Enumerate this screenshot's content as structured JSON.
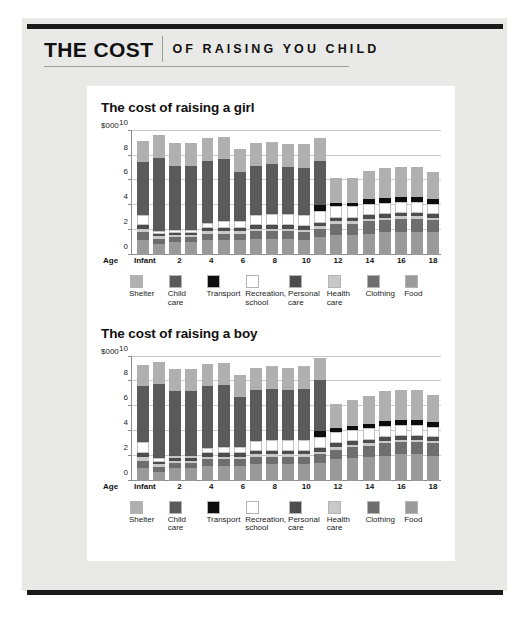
{
  "masthead": {
    "main": "THE COST",
    "sub": "OF RAISING YOU CHILD"
  },
  "colors": {
    "shelter": "#b0b0b0",
    "child_care": "#5a5a5a",
    "transport": "#0d0d0d",
    "recreation_school": "#ffffff",
    "personal_care": "#4d4d4d",
    "health_care": "#c9c9c9",
    "clothing": "#6e6e6e",
    "food": "#9a9a9a",
    "page_background": "#e9e9e7",
    "panel_background": "#ffffff",
    "rule": "#1a1a1a",
    "gridline": "#c9c9c9",
    "axis": "#8d8d8d"
  },
  "legend": {
    "items": [
      {
        "label": "Shelter",
        "color_key": "shelter"
      },
      {
        "label": "Child\ncare",
        "color_key": "child_care"
      },
      {
        "label": "Transport",
        "color_key": "transport"
      },
      {
        "label": "Recreation,\nschool",
        "color_key": "recreation_school"
      },
      {
        "label": "Personal\ncare",
        "color_key": "personal_care"
      },
      {
        "label": "Health\ncare",
        "color_key": "health_care"
      },
      {
        "label": "Clothing",
        "color_key": "clothing"
      },
      {
        "label": "Food",
        "color_key": "food"
      }
    ]
  },
  "chart_data": [
    {
      "type": "bar",
      "stacked": true,
      "title": "The cost of raising a girl",
      "ylabel": "$000",
      "xlabel": "Age",
      "ylim": [
        0,
        10
      ],
      "yticks": [
        0,
        2,
        4,
        6,
        8,
        10
      ],
      "grid": true,
      "legend_position": "bottom",
      "categories": [
        "Infant",
        "1",
        "2",
        "3",
        "4",
        "5",
        "6",
        "7",
        "8",
        "9",
        "10",
        "11",
        "12",
        "13",
        "14",
        "15",
        "16",
        "17",
        "18"
      ],
      "tick_labels": [
        "Infant",
        "",
        "2",
        "",
        "4",
        "",
        "6",
        "",
        "8",
        "",
        "10",
        "",
        "12",
        "",
        "14",
        "",
        "16",
        "",
        "18"
      ],
      "series": [
        {
          "name": "Food",
          "color_key": "food",
          "values": [
            1.2,
            0.9,
            1.0,
            1.0,
            1.2,
            1.2,
            1.2,
            1.3,
            1.3,
            1.3,
            1.2,
            1.4,
            1.6,
            1.6,
            1.7,
            1.8,
            1.8,
            1.8,
            1.8
          ]
        },
        {
          "name": "Clothing",
          "color_key": "clothing",
          "values": [
            0.6,
            0.4,
            0.4,
            0.4,
            0.5,
            0.5,
            0.5,
            0.6,
            0.6,
            0.6,
            0.6,
            0.7,
            0.9,
            0.9,
            1.0,
            1.0,
            1.1,
            1.1,
            1.0
          ]
        },
        {
          "name": "Health care",
          "color_key": "health_care",
          "values": [
            0.3,
            0.2,
            0.2,
            0.2,
            0.2,
            0.2,
            0.2,
            0.2,
            0.2,
            0.2,
            0.2,
            0.2,
            0.2,
            0.2,
            0.2,
            0.2,
            0.2,
            0.2,
            0.2
          ]
        },
        {
          "name": "Personal care",
          "color_key": "personal_care",
          "values": [
            0.3,
            0.2,
            0.2,
            0.2,
            0.3,
            0.3,
            0.3,
            0.3,
            0.3,
            0.3,
            0.3,
            0.3,
            0.3,
            0.3,
            0.3,
            0.3,
            0.3,
            0.3,
            0.3
          ]
        },
        {
          "name": "Recreation, school",
          "color_key": "recreation_school",
          "values": [
            0.8,
            0.2,
            0.2,
            0.2,
            0.4,
            0.5,
            0.5,
            0.8,
            0.9,
            0.9,
            0.9,
            0.9,
            0.9,
            0.9,
            0.9,
            0.9,
            0.9,
            0.9,
            0.8
          ]
        },
        {
          "name": "Transport",
          "color_key": "transport",
          "values": [
            0.0,
            0.0,
            0.0,
            0.0,
            0.0,
            0.0,
            0.0,
            0.0,
            0.0,
            0.0,
            0.0,
            0.5,
            0.3,
            0.3,
            0.4,
            0.4,
            0.4,
            0.4,
            0.4
          ]
        },
        {
          "name": "Child care",
          "color_key": "child_care",
          "values": [
            4.3,
            5.9,
            5.2,
            5.2,
            5.0,
            5.0,
            4.0,
            4.0,
            4.0,
            3.8,
            3.8,
            3.6,
            0.0,
            0.0,
            0.0,
            0.0,
            0.0,
            0.0,
            0.0
          ]
        },
        {
          "name": "Shelter",
          "color_key": "shelter",
          "values": [
            1.7,
            1.9,
            1.8,
            1.8,
            1.8,
            1.8,
            1.8,
            1.8,
            1.8,
            1.8,
            1.9,
            1.8,
            2.0,
            2.0,
            2.3,
            2.4,
            2.4,
            2.4,
            2.2
          ]
        }
      ]
    },
    {
      "type": "bar",
      "stacked": true,
      "title": "The cost of raising a boy",
      "ylabel": "$000",
      "xlabel": "Age",
      "ylim": [
        0,
        10
      ],
      "yticks": [
        0,
        2,
        4,
        6,
        8,
        10
      ],
      "grid": true,
      "legend_position": "bottom",
      "categories": [
        "Infant",
        "1",
        "2",
        "3",
        "4",
        "5",
        "6",
        "7",
        "8",
        "9",
        "10",
        "11",
        "12",
        "13",
        "14",
        "15",
        "16",
        "17",
        "18"
      ],
      "tick_labels": [
        "Infant",
        "",
        "2",
        "",
        "4",
        "",
        "6",
        "",
        "8",
        "",
        "10",
        "",
        "12",
        "",
        "14",
        "",
        "16",
        "",
        "18"
      ],
      "series": [
        {
          "name": "Food",
          "color_key": "food",
          "values": [
            1.0,
            0.7,
            1.0,
            1.0,
            1.2,
            1.2,
            1.2,
            1.3,
            1.3,
            1.3,
            1.3,
            1.4,
            1.7,
            1.8,
            1.9,
            2.0,
            2.1,
            2.1,
            2.0
          ]
        },
        {
          "name": "Clothing",
          "color_key": "clothing",
          "values": [
            0.6,
            0.4,
            0.4,
            0.4,
            0.5,
            0.5,
            0.5,
            0.6,
            0.6,
            0.6,
            0.6,
            0.7,
            0.8,
            0.9,
            0.9,
            1.0,
            1.0,
            1.0,
            1.0
          ]
        },
        {
          "name": "Health care",
          "color_key": "health_care",
          "values": [
            0.3,
            0.2,
            0.2,
            0.2,
            0.2,
            0.2,
            0.2,
            0.2,
            0.2,
            0.2,
            0.2,
            0.2,
            0.2,
            0.2,
            0.2,
            0.2,
            0.2,
            0.2,
            0.2
          ]
        },
        {
          "name": "Personal care",
          "color_key": "personal_care",
          "values": [
            0.3,
            0.2,
            0.2,
            0.2,
            0.3,
            0.3,
            0.3,
            0.3,
            0.3,
            0.3,
            0.3,
            0.3,
            0.3,
            0.3,
            0.3,
            0.3,
            0.3,
            0.3,
            0.3
          ]
        },
        {
          "name": "Recreation, school",
          "color_key": "recreation_school",
          "values": [
            0.9,
            0.3,
            0.2,
            0.2,
            0.4,
            0.5,
            0.5,
            0.8,
            0.9,
            0.9,
            0.9,
            0.9,
            0.9,
            0.9,
            0.9,
            0.9,
            0.9,
            0.9,
            0.8
          ]
        },
        {
          "name": "Transport",
          "color_key": "transport",
          "values": [
            0.0,
            0.0,
            0.0,
            0.0,
            0.0,
            0.0,
            0.0,
            0.0,
            0.0,
            0.0,
            0.0,
            0.5,
            0.3,
            0.3,
            0.4,
            0.4,
            0.4,
            0.4,
            0.4
          ]
        },
        {
          "name": "Child care",
          "color_key": "child_care",
          "values": [
            4.5,
            6.0,
            5.2,
            5.2,
            5.0,
            5.0,
            4.0,
            4.1,
            4.1,
            4.0,
            4.1,
            4.1,
            0.0,
            0.0,
            0.0,
            0.0,
            0.0,
            0.0,
            0.0
          ]
        },
        {
          "name": "Shelter",
          "color_key": "shelter",
          "values": [
            1.7,
            1.8,
            1.8,
            1.8,
            1.8,
            1.8,
            1.8,
            1.8,
            1.8,
            1.8,
            1.8,
            1.8,
            2.0,
            2.1,
            2.2,
            2.4,
            2.4,
            2.4,
            2.2
          ]
        }
      ]
    }
  ]
}
